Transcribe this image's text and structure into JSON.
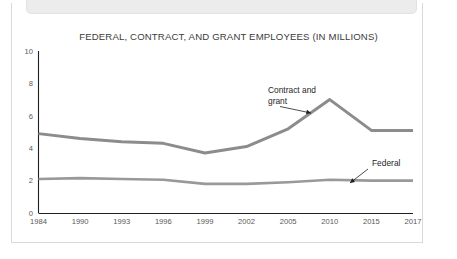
{
  "top_banner": {
    "name": "cropped-header-banner",
    "text": "",
    "background": "#ececec"
  },
  "figure": {
    "border_color": "#d9d9d9"
  },
  "chart_data": {
    "type": "line",
    "title": "FEDERAL, CONTRACT, AND GRANT EMPLOYEES (IN MILLIONS)",
    "xlabel": "",
    "ylabel": "",
    "ylim": [
      0,
      10
    ],
    "yticks": [
      0,
      2,
      4,
      6,
      8,
      10
    ],
    "ytick_labels": [
      "0",
      "2",
      "4",
      "6",
      "8",
      "10"
    ],
    "grid": false,
    "legend": "annotations-inline",
    "categories": [
      "1984",
      "1990",
      "1993",
      "1996",
      "1999",
      "2002",
      "2005",
      "2010",
      "2015",
      "2017"
    ],
    "series": [
      {
        "name": "Contract and grant",
        "color": "#8c8c8c",
        "stroke_width": 3.0,
        "values": [
          4.9,
          4.6,
          4.4,
          4.3,
          3.7,
          4.1,
          5.2,
          7.0,
          5.1,
          5.1
        ]
      },
      {
        "name": "Federal",
        "color": "#999999",
        "stroke_width": 2.6,
        "values": [
          2.1,
          2.15,
          2.1,
          2.05,
          1.8,
          1.8,
          1.9,
          2.05,
          2.0,
          2.0
        ]
      }
    ],
    "annotations": [
      {
        "name": "contract-and-grant",
        "lines": [
          "Contract and",
          "grant"
        ],
        "text": "Contract and grant",
        "label_x": 268,
        "label_y": 93,
        "point_x": 311,
        "point_y": 113
      },
      {
        "name": "federal",
        "lines": [
          "Federal"
        ],
        "text": "Federal",
        "label_x": 372,
        "label_y": 166,
        "point_x": 350,
        "point_y": 183
      }
    ]
  }
}
